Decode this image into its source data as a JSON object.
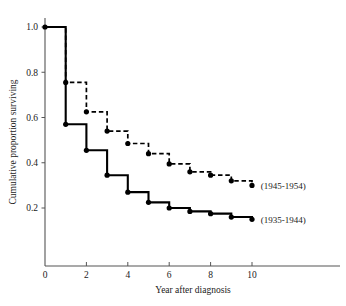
{
  "chart_data": {
    "type": "line",
    "title": "",
    "subtitle": "",
    "xlabel": "Year after diagnosis",
    "ylabel": "Cumulative proportion surviving",
    "xlim": [
      0,
      11.6
    ],
    "ylim": [
      0,
      1.05
    ],
    "xticks": [
      0,
      2,
      4,
      6,
      8,
      10
    ],
    "xtick_labels": [
      "0",
      "2",
      "4",
      "6",
      "8",
      "10"
    ],
    "yticks": [
      0.2,
      0.4,
      0.6,
      0.8,
      1.0
    ],
    "ytick_labels": [
      "0.2",
      "0.4",
      "0.6",
      "0.8",
      "1.0"
    ],
    "grid": false,
    "legend_position": "inline-right",
    "style": "step-post",
    "series": [
      {
        "name": "(1945-1954)",
        "linestyle": "dashed",
        "color": "#000000",
        "marker": "circle",
        "x": [
          1,
          2,
          3,
          4,
          5,
          6,
          7,
          8,
          9,
          10
        ],
        "values": [
          0.755,
          0.625,
          0.54,
          0.485,
          0.44,
          0.395,
          0.36,
          0.345,
          0.32,
          0.3
        ],
        "label_x": 10.35,
        "label_y": 0.3
      },
      {
        "name": "(1935-1944)",
        "linestyle": "solid",
        "color": "#000000",
        "marker": "circle",
        "x": [
          0,
          1,
          2,
          3,
          4,
          5,
          6,
          7,
          8,
          9,
          10
        ],
        "values": [
          1.0,
          0.57,
          0.455,
          0.345,
          0.27,
          0.225,
          0.2,
          0.185,
          0.175,
          0.16,
          0.15
        ],
        "label_x": 10.35,
        "label_y": 0.15
      }
    ],
    "annotations": [
      {
        "text": "(1945-1954)",
        "series": "(1945-1954)"
      },
      {
        "text": "(1935-1944)",
        "series": "(1935-1944)"
      }
    ]
  },
  "axes": {
    "x_title": "Year after diagnosis",
    "y_title": "Cumulative proportion surviving",
    "x_tick_labels": [
      "0",
      "2",
      "4",
      "6",
      "8",
      "10"
    ],
    "y_tick_labels": [
      "0.2",
      "0.4",
      "0.6",
      "0.8",
      "1.0"
    ]
  },
  "colors": {
    "axis": "#555555",
    "line": "#000000",
    "text": "#1a1a1a",
    "background": "#ffffff"
  }
}
